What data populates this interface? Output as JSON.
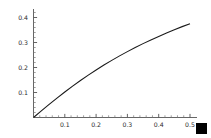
{
  "chart_data": {
    "type": "line",
    "title": "",
    "subtitle": "",
    "xlabel": "",
    "ylabel": "",
    "xlim": [
      0,
      0.52
    ],
    "ylim": [
      0,
      0.42
    ],
    "grid": false,
    "legend": null,
    "legend_position": "none",
    "x_ticks": [
      0.1,
      0.2,
      0.3,
      0.4,
      0.5
    ],
    "x_tick_labels": [
      "0.1",
      "0.2",
      "0.3",
      "0.4",
      "0.5"
    ],
    "x_minor_tick_step": 0.02,
    "y_ticks": [
      0.1,
      0.2,
      0.3,
      0.4
    ],
    "y_tick_labels": [
      "0.1",
      "0.2",
      "0.3",
      "0.4"
    ],
    "y_minor_tick_step": 0.02,
    "series": [
      {
        "name": "curve",
        "color": "#1a1a1a",
        "x": [
          0.0,
          0.025,
          0.05,
          0.075,
          0.1,
          0.125,
          0.15,
          0.175,
          0.2,
          0.225,
          0.25,
          0.275,
          0.3,
          0.325,
          0.35,
          0.375,
          0.4,
          0.425,
          0.45,
          0.475,
          0.5
        ],
        "y": [
          0.0,
          0.0265,
          0.0525,
          0.0775,
          0.102,
          0.1255,
          0.148,
          0.1695,
          0.19,
          0.2098,
          0.2285,
          0.2465,
          0.2635,
          0.28,
          0.2955,
          0.3105,
          0.3245,
          0.338,
          0.3512,
          0.3635,
          0.375
        ]
      }
    ],
    "annotations": [
      {
        "name": "corner-square-marker",
        "shape": "filled-square",
        "color": "#000000",
        "position": "bottom-right"
      }
    ]
  },
  "axes": {
    "x_axis_name": "x-axis",
    "y_axis_name": "y-axis"
  }
}
